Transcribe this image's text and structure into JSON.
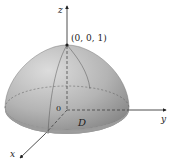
{
  "figure": {
    "type": "3d-surface-diagram",
    "labels": {
      "z_axis": "z",
      "y_axis": "y",
      "x_axis": "x",
      "apex_point": "(0, 0, 1)",
      "origin": "0",
      "region": "D"
    },
    "colors": {
      "surface_light": "#d8d8d8",
      "surface_dark": "#8f8f8f",
      "base_disk": "#9a9a9a",
      "axis": "#222222",
      "grid_line": "#555555"
    }
  }
}
